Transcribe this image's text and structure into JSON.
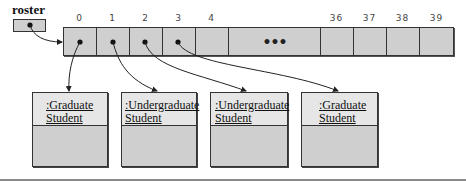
{
  "variable": {
    "name": "roster"
  },
  "array": {
    "indices": [
      "0",
      "1",
      "2",
      "3",
      "4",
      "36",
      "37",
      "38",
      "39"
    ],
    "ellipsis": "•••"
  },
  "students": [
    {
      "line1": ":Graduate",
      "line2": "Student"
    },
    {
      "line1": ":Undergraduate",
      "line2": "Student"
    },
    {
      "line1": ":Undergraduate",
      "line2": "Student"
    },
    {
      "line1": ":Graduate",
      "line2": "Student"
    }
  ],
  "colors": {
    "fill": "#cfcfcf",
    "header_fill": "#e6e6e6",
    "stroke": "#333333"
  }
}
